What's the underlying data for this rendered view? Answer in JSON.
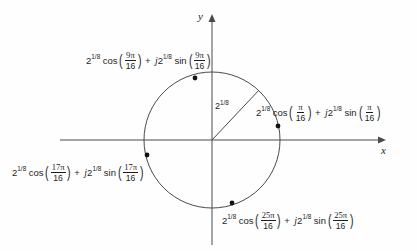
{
  "figure": {
    "type": "complex-plane-diagram",
    "background_color": "#fefefe",
    "line_color": "#3a3a3a",
    "axes": {
      "x_label": "x",
      "y_label": "y",
      "origin": [
        212,
        140
      ]
    },
    "circle": {
      "radius_px": 68,
      "radius_label_base": "2",
      "radius_label_exponent": "1/8"
    }
  },
  "points": [
    {
      "name": "point-9pi-16",
      "angle_numerator": "9π",
      "angle_denominator": "16",
      "magnitude_base": "2",
      "magnitude_exponent": "1/8",
      "cos_fn": "cos",
      "sin_fn": "sin",
      "plus": "+",
      "imaginary_unit": "j",
      "position": [
        195,
        78
      ]
    },
    {
      "name": "point-pi-16",
      "angle_numerator": "π",
      "angle_denominator": "16",
      "magnitude_base": "2",
      "magnitude_exponent": "1/8",
      "cos_fn": "cos",
      "sin_fn": "sin",
      "plus": "+",
      "imaginary_unit": "j",
      "position": [
        278,
        126
      ]
    },
    {
      "name": "point-17pi-16",
      "angle_numerator": "17π",
      "angle_denominator": "16",
      "magnitude_base": "2",
      "magnitude_exponent": "1/8",
      "cos_fn": "cos",
      "sin_fn": "sin",
      "plus": "+",
      "imaginary_unit": "j",
      "position": [
        147,
        155
      ]
    },
    {
      "name": "point-25pi-16",
      "angle_numerator": "25π",
      "angle_denominator": "16",
      "magnitude_base": "2",
      "magnitude_exponent": "1/8",
      "cos_fn": "cos",
      "sin_fn": "sin",
      "plus": "+",
      "imaginary_unit": "j",
      "position": [
        232,
        203
      ]
    }
  ]
}
